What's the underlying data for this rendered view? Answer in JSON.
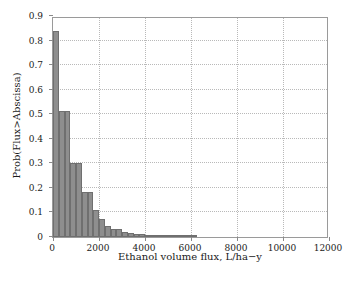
{
  "figure": {
    "caption_fragment": "",
    "background_color": "#ffffff"
  },
  "chart_data": {
    "type": "bar",
    "title": "",
    "subtitle": "",
    "xlabel": "Ethanol volume flux, L/ha−y",
    "ylabel": "Prob(Flux>Abscissa)",
    "xlim": [
      0,
      12000
    ],
    "ylim": [
      0,
      0.9
    ],
    "xticks": [
      0,
      2000,
      4000,
      6000,
      8000,
      10000,
      12000
    ],
    "xtick_labels": [
      "0",
      "2000",
      "4000",
      "6000",
      "8000",
      "10000",
      "12000"
    ],
    "yticks": [
      0,
      0.1,
      0.2,
      0.3,
      0.4,
      0.5,
      0.6,
      0.7,
      0.8,
      0.9
    ],
    "ytick_labels": [
      "0",
      "0.1",
      "0.2",
      "0.3",
      "0.4",
      "0.5",
      "0.6",
      "0.7",
      "0.8",
      "0.9"
    ],
    "grid": true,
    "grid_style": "dotted",
    "legend": null,
    "legend_position": "none",
    "bar_color": "#8e8e8e",
    "bar_edge_color": "#6f6f6f",
    "bar_width": 250,
    "categories": [
      250,
      500,
      750,
      1000,
      1250,
      1500,
      1750,
      2000,
      2250,
      2500,
      2750,
      3000,
      3250,
      3500,
      3750,
      4000,
      4250,
      4500,
      4750,
      5000,
      5250,
      5500,
      5750,
      6000,
      6250
    ],
    "values": [
      0.84,
      0.515,
      0.515,
      0.302,
      0.302,
      0.183,
      0.183,
      0.112,
      0.072,
      0.046,
      0.031,
      0.031,
      0.022,
      0.015,
      0.013,
      0.011,
      0.009,
      0.008,
      0.007,
      0.006,
      0.005,
      0.004,
      0.003,
      0.002,
      0.002
    ],
    "series": [
      {
        "name": "Prob(Flux>Abscissa)",
        "values": [
          0.84,
          0.515,
          0.515,
          0.302,
          0.302,
          0.183,
          0.183,
          0.112,
          0.072,
          0.046,
          0.031,
          0.031,
          0.022,
          0.015,
          0.013,
          0.011,
          0.009,
          0.008,
          0.007,
          0.006,
          0.005,
          0.004,
          0.003,
          0.002,
          0.002
        ]
      }
    ]
  }
}
